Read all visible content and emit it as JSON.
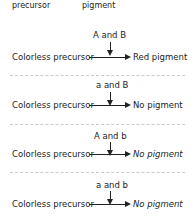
{
  "header": {
    "left_label": "precursor",
    "right_label": "pigment"
  },
  "rows": [
    {
      "genotype": "A and B",
      "input": "Colorless precursor",
      "output": "Red pigment"
    },
    {
      "genotype": "a and B",
      "input": "Colorless precursor",
      "output": "No pigment"
    },
    {
      "genotype": "A and b",
      "input": "Colorless precursor",
      "output": "No pigment"
    },
    {
      "genotype": "a and b",
      "input": "Colorless precursor",
      "output": "No pigment"
    }
  ]
}
